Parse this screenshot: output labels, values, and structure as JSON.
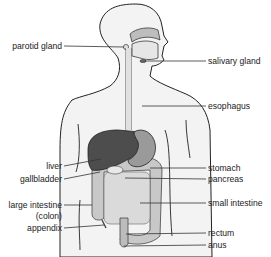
{
  "diagram": {
    "colors": {
      "body_fill": "#f3f3f3",
      "outline": "#222222",
      "liver": "#4d4d4d",
      "stomach": "#9a9a9a",
      "intestine": "#c8c8c8",
      "small_intestine": "#d9d9d9",
      "leader_line": "#333333"
    },
    "labels_left": [
      {
        "id": "parotid-gland",
        "text": "parotid gland"
      },
      {
        "id": "liver",
        "text": "liver"
      },
      {
        "id": "gallbladder",
        "text": "gallbladder"
      },
      {
        "id": "large-intestine",
        "text": "large intestine"
      },
      {
        "id": "colon",
        "text": "(colon)"
      },
      {
        "id": "appendix",
        "text": "appendix"
      }
    ],
    "labels_right": [
      {
        "id": "salivary-gland",
        "text": "salivary gland"
      },
      {
        "id": "esophagus",
        "text": "esophagus"
      },
      {
        "id": "stomach",
        "text": "stomach"
      },
      {
        "id": "pancreas",
        "text": "pancreas"
      },
      {
        "id": "small-intestine",
        "text": "small intestine"
      },
      {
        "id": "rectum",
        "text": "rectum"
      },
      {
        "id": "anus",
        "text": "anus"
      }
    ]
  }
}
